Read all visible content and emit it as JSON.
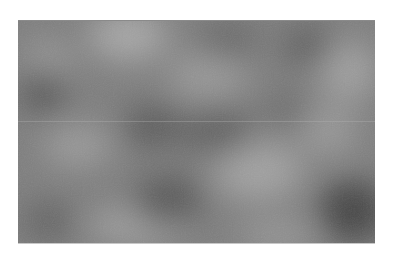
{
  "image": {
    "description": "Grayscale procedural cloud / Perlin noise texture",
    "colors": {
      "background": "#ffffff",
      "base_gray": "#7d7d7d",
      "light_gray": "#a6a6a6",
      "dark_gray": "#4f4f4f"
    }
  }
}
